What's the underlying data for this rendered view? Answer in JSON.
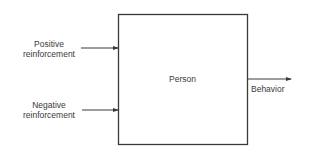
{
  "diagram": {
    "box": {
      "label": "Person"
    },
    "inputs": [
      {
        "line1": "Positive",
        "line2": "reinforcement"
      },
      {
        "line1": "Negative",
        "line2": "reinforcement"
      }
    ],
    "output": {
      "label": "Behavior"
    },
    "colors": {
      "stroke": "#3a3a3a",
      "text": "#3a3a3a",
      "background": "#ffffff"
    }
  }
}
